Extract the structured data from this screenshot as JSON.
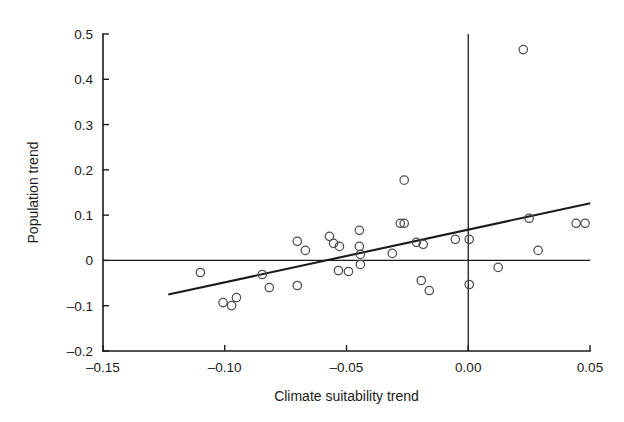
{
  "chart_data": {
    "type": "scatter",
    "title": "",
    "xlabel": "Climate suitability trend",
    "ylabel": "Population trend",
    "xlim": [
      -0.15,
      0.05
    ],
    "ylim": [
      -0.2,
      0.5
    ],
    "grid": false,
    "legend": null,
    "x_ticks": [
      -0.15,
      -0.1,
      -0.05,
      0.0,
      0.05
    ],
    "x_tick_labels": [
      "–0.15",
      "–0.10",
      "–0.05",
      "0.00",
      "0.05"
    ],
    "y_ticks": [
      -0.2,
      -0.1,
      0,
      0.1,
      0.2,
      0.3,
      0.4,
      0.5
    ],
    "y_tick_labels": [
      "–0.2",
      "–0.1",
      "0",
      "0.1",
      "0.2",
      "0.3",
      "0.4",
      "0.5"
    ],
    "marker": "open-circle",
    "marker_radius": 4.2,
    "reference_lines": [
      {
        "name": "zero-horizontal",
        "orientation": "horizontal",
        "value": 0
      },
      {
        "name": "zero-vertical",
        "orientation": "vertical",
        "value": 0
      }
    ],
    "trend_line": {
      "name": "regression-line",
      "x_start": -0.1232,
      "y_start": -0.0754,
      "x_end": 0.0501,
      "y_end": 0.1264,
      "slope": 1.165,
      "intercept": 0.0681
    },
    "points": [
      {
        "x": -0.11,
        "y": -0.0266
      },
      {
        "x": -0.1007,
        "y": -0.0931
      },
      {
        "x": -0.0972,
        "y": -0.0998
      },
      {
        "x": -0.0952,
        "y": -0.082
      },
      {
        "x": -0.0846,
        "y": -0.031
      },
      {
        "x": -0.0817,
        "y": -0.0599
      },
      {
        "x": -0.0702,
        "y": -0.0554
      },
      {
        "x": -0.0702,
        "y": 0.0421
      },
      {
        "x": -0.0669,
        "y": 0.0222
      },
      {
        "x": -0.057,
        "y": 0.0532
      },
      {
        "x": -0.0553,
        "y": 0.0377
      },
      {
        "x": -0.0529,
        "y": 0.031
      },
      {
        "x": -0.0533,
        "y": -0.0222
      },
      {
        "x": -0.0492,
        "y": -0.0244
      },
      {
        "x": -0.0447,
        "y": 0.031
      },
      {
        "x": -0.0443,
        "y": 0.0133
      },
      {
        "x": -0.0443,
        "y": -0.0089
      },
      {
        "x": -0.0447,
        "y": 0.0665
      },
      {
        "x": -0.0312,
        "y": 0.0155
      },
      {
        "x": -0.0279,
        "y": 0.082
      },
      {
        "x": -0.0263,
        "y": 0.1773
      },
      {
        "x": -0.0263,
        "y": 0.082
      },
      {
        "x": -0.0213,
        "y": 0.0399
      },
      {
        "x": -0.0185,
        "y": 0.0355
      },
      {
        "x": -0.0193,
        "y": -0.0443
      },
      {
        "x": -0.016,
        "y": -0.0665
      },
      {
        "x": -0.0053,
        "y": 0.0466
      },
      {
        "x": 0.0004,
        "y": 0.0466
      },
      {
        "x": 0.0004,
        "y": -0.0532
      },
      {
        "x": 0.0123,
        "y": -0.0155
      },
      {
        "x": 0.025,
        "y": 0.0931
      },
      {
        "x": 0.0287,
        "y": 0.0222
      },
      {
        "x": 0.0226,
        "y": 0.4656
      },
      {
        "x": 0.0443,
        "y": 0.082
      },
      {
        "x": 0.048,
        "y": 0.082
      }
    ]
  },
  "colors": {
    "axis": "#1a1a1a",
    "marker_stroke": "#4d4d4d",
    "trend": "#1a1a1a",
    "background": "#ffffff"
  }
}
